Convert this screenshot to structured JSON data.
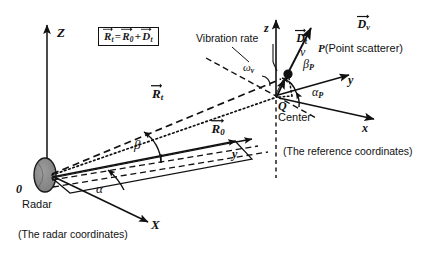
{
  "figure": {
    "type": "radar-vibration-geometry-diagram",
    "formula": {
      "lhs": "R",
      "lhs_sub": "t",
      "eq": "=",
      "term1": "R",
      "term1_sub": "0",
      "plus": "+",
      "term2": "D",
      "term2_sub": "t",
      "plain_text": "Rt = R0 + Dt"
    },
    "global_axes": {
      "z": "Z",
      "x": "X",
      "origin": "0"
    },
    "local_axes": {
      "z": "z",
      "y": "y",
      "x": "x",
      "origin": "Q"
    },
    "vectors": [
      {
        "id": "R_t",
        "letter": "R",
        "sub": "t",
        "style": "dashed",
        "label_x": 152,
        "label_y": 89
      },
      {
        "id": "R_0",
        "letter": "R",
        "sub": "0",
        "style": "dotted",
        "label_x": 193,
        "label_y": 124
      },
      {
        "id": "D_t",
        "letter": "D",
        "sub": "t",
        "style": "solid",
        "label_x": 272,
        "label_y": 32
      },
      {
        "id": "D_v",
        "letter": "D",
        "sub": "v",
        "style": "solid",
        "label_x": 313,
        "label_y": 19
      }
    ],
    "angles": [
      {
        "id": "alpha",
        "symbol": "α",
        "sub": "",
        "label_x": 96,
        "label_y": 188
      },
      {
        "id": "beta",
        "symbol": "β",
        "sub": "",
        "label_x": 135,
        "label_y": 144
      },
      {
        "id": "alpha_P",
        "symbol": "α",
        "sub": "P",
        "label_x": 317,
        "label_y": 89
      },
      {
        "id": "beta_P",
        "symbol": "β",
        "sub": "P",
        "label_x": 307,
        "label_y": 63
      },
      {
        "id": "omega_v",
        "symbol": "ω",
        "sub": "v",
        "label_x": 249,
        "label_y": 66
      }
    ],
    "labels": {
      "radar": "Radar",
      "radar_coordinates": "(The radar coordinates)",
      "reference_coordinates": "(The reference coordinates)",
      "vibration_rate": "Vibration rate",
      "center": "Center",
      "point_scatterer": "P (Point scatterer)",
      "point_scatterer_italic": "P",
      "point_scatterer_paren": "(Point scatterer)",
      "velocity": "v"
    },
    "colors": {
      "stroke": "#111111",
      "background": "#ffffff",
      "radar_dish_fill": "#8a8a8a",
      "radar_dish_stroke": "#1a1a1a"
    }
  }
}
